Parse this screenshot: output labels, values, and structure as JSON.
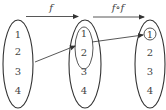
{
  "diagram": {
    "type": "function-mapping",
    "sets": [
      {
        "id": "domain",
        "elements": [
          "1",
          "2",
          "3",
          "4"
        ]
      },
      {
        "id": "middle",
        "elements": [
          "1",
          "2",
          "3",
          "4"
        ],
        "highlighted_subset": [
          "1",
          "2"
        ]
      },
      {
        "id": "codomain",
        "elements": [
          "1",
          "2",
          "3",
          "4"
        ],
        "highlighted_element": "1"
      }
    ],
    "arrows": [
      {
        "label": "f",
        "from": "domain",
        "to": "middle"
      },
      {
        "label": "f∘f",
        "from": "middle",
        "to": "codomain"
      }
    ],
    "mappings": [
      {
        "from": "domain",
        "to": "middle subset {1,2}"
      },
      {
        "from": "middle subset {1,2}",
        "to": "codomain 1"
      }
    ]
  },
  "labels": {
    "f": "f",
    "ff": "f∘f"
  },
  "set1": {
    "e1": "1",
    "e2": "2",
    "e3": "3",
    "e4": "4"
  },
  "set2": {
    "e1": "1",
    "e2": "2",
    "e3": "3",
    "e4": "4"
  },
  "set3": {
    "e1": "1",
    "e2": "2",
    "e3": "3",
    "e4": "4"
  },
  "colors": {
    "stroke": "#333333",
    "text": "#444444",
    "background": "#ffffff"
  }
}
